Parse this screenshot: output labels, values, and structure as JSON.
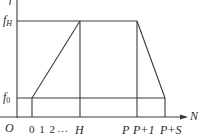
{
  "diagram": {
    "type": "piecewise-linear plot",
    "y_axis_label": "f",
    "x_axis_label": "N",
    "origin_label": "O",
    "y_ticks": [
      {
        "label_base": "f",
        "label_sub": "H"
      },
      {
        "label_base": "f",
        "label_sub": "0"
      }
    ],
    "x_ticks": [
      "0",
      "1",
      "2",
      "…",
      "H",
      "P",
      "P+1",
      "P+S"
    ],
    "x_tick_labels": {
      "t012": "0 1 2",
      "dots": "…",
      "H": "H",
      "P": "P",
      "P1": "P+1",
      "PS": "P+S"
    },
    "line_color": "#3a3a3a",
    "segments": [
      {
        "from": [
          "0",
          "f0"
        ],
        "to": [
          "H",
          "fH"
        ],
        "desc": "linear ramp up"
      },
      {
        "from": [
          "H",
          "fH"
        ],
        "to": [
          "P+1",
          "fH"
        ],
        "desc": "plateau"
      },
      {
        "from": [
          "P+1",
          "fH"
        ],
        "to": [
          "P+S",
          "f0"
        ],
        "desc": "linear ramp down"
      }
    ]
  }
}
